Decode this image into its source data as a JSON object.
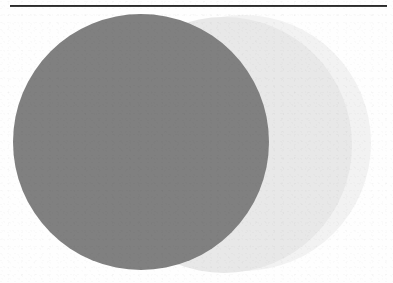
{
  "figure": {
    "kind": "overlapping-circles-diagram",
    "background_color": "#fefefe",
    "width": 393,
    "height": 283,
    "rule": {
      "label": "",
      "color": "#1e1e1e",
      "x": 10,
      "y": 5,
      "width": 377,
      "height": 2
    },
    "circles": [
      {
        "name": "right-light-circle",
        "label": "",
        "color": "#f2f2f2",
        "center_x": 243,
        "center_y": 143,
        "radius": 128
      },
      {
        "name": "middle-light-circle",
        "label": "",
        "color": "#e8e8e8",
        "center_x": 224,
        "center_y": 145,
        "radius": 128
      },
      {
        "name": "dark-gray-circle",
        "label": "",
        "color": "#808080",
        "center_x": 141,
        "center_y": 142,
        "radius": 128
      }
    ]
  },
  "chart_data": {
    "type": "scatter",
    "title": "",
    "xlabel": "",
    "ylabel": "",
    "grid": false,
    "legend_position": "none",
    "annotations": [],
    "shapes": [
      {
        "shape": "circle",
        "cx": 243,
        "cy": 143,
        "r": 128,
        "fill": "#f2f2f2",
        "order": 1
      },
      {
        "shape": "circle",
        "cx": 224,
        "cy": 145,
        "r": 128,
        "fill": "#e8e8e8",
        "order": 2
      },
      {
        "shape": "circle",
        "cx": 141,
        "cy": 142,
        "r": 128,
        "fill": "#808080",
        "order": 3
      },
      {
        "shape": "line",
        "x1": 10,
        "y1": 6,
        "x2": 387,
        "y2": 6,
        "stroke": "#1e1e1e",
        "order": 4
      }
    ]
  }
}
